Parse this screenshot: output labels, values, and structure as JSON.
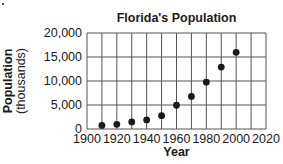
{
  "chart_data": {
    "type": "scatter",
    "title": "Florida's Population",
    "xlabel": "Year",
    "ylabel": "Population",
    "ylabel_sub": "(thousands)",
    "x": [
      1910,
      1920,
      1930,
      1940,
      1950,
      1960,
      1970,
      1980,
      1990,
      2000
    ],
    "values": [
      750,
      970,
      1470,
      1900,
      2770,
      4950,
      6790,
      9750,
      12900,
      15980
    ],
    "xlim": [
      1900,
      2020
    ],
    "ylim": [
      0,
      20000
    ],
    "x_ticks": [
      1900,
      1920,
      1940,
      1960,
      1980,
      2000,
      2020
    ],
    "x_tick_labels": [
      "1900",
      "1920",
      "1940",
      "1960",
      "1980",
      "2000",
      "2020"
    ],
    "y_ticks": [
      0,
      5000,
      10000,
      15000,
      20000
    ],
    "y_tick_labels": [
      "0",
      "5,000",
      "10,000",
      "15,000",
      "20,000"
    ],
    "grid": true,
    "x_grid_step": 10,
    "y_grid_step": 5000,
    "legend": null,
    "marker_color": "#1a1a1a"
  }
}
